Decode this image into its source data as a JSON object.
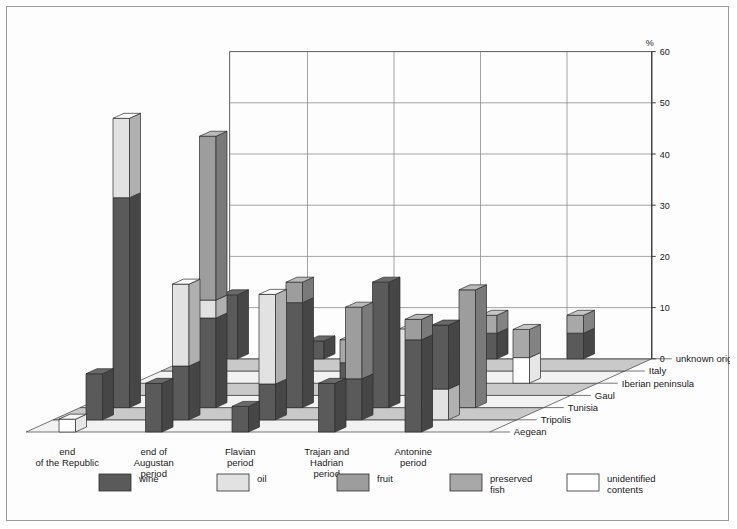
{
  "chart_data": {
    "type": "bar",
    "title": "",
    "subtitle": "",
    "xlabel": "",
    "ylabel": "%",
    "ylim": [
      0,
      60
    ],
    "yticks": [
      0,
      10,
      20,
      30,
      40,
      50,
      60
    ],
    "grid": true,
    "legend_position": "bottom",
    "projection": "3d-stacked",
    "categories": [
      "end\nof the Republic",
      "end of\nAugustan\nperiod",
      "Flavian\nperiod",
      "Trajan and\nHadrian\nperiod",
      "Antonine\nperiod"
    ],
    "depth_categories": [
      "unknown origin",
      "Italy",
      "Iberian peninsula",
      "Gaul",
      "Tunisia",
      "Tripolis",
      "Aegean"
    ],
    "series": [
      {
        "name": "wine",
        "color": "#5a5a5a"
      },
      {
        "name": "oil",
        "color": "#e2e2e2"
      },
      {
        "name": "fruit",
        "color": "#9d9d9d"
      },
      {
        "name": "preserved fish",
        "color": "#a8a8a8"
      },
      {
        "name": "unidentified contents",
        "color": "#ffffff"
      }
    ],
    "bars": [
      {
        "period": 0,
        "origin": 6,
        "stack": [
          {
            "s": "wine",
            "v": 12.5
          }
        ]
      },
      {
        "period": 0,
        "origin": 5,
        "stack": [
          {
            "s": "unidentified contents",
            "v": 3.0
          }
        ]
      },
      {
        "period": 0,
        "origin": 2,
        "stack": [
          {
            "s": "wine",
            "v": 41.0
          },
          {
            "s": "oil",
            "v": 15.5
          }
        ]
      },
      {
        "period": 0,
        "origin": 1,
        "stack": [
          {
            "s": "wine",
            "v": 9.0
          }
        ]
      },
      {
        "period": 0,
        "origin": 0,
        "stack": [
          {
            "s": "unidentified contents",
            "v": 2.5
          }
        ]
      },
      {
        "period": 1,
        "origin": 6,
        "stack": [
          {
            "s": "wine",
            "v": 3.5
          }
        ]
      },
      {
        "period": 1,
        "origin": 5,
        "stack": [
          {
            "s": "unidentified contents",
            "v": 3.0
          }
        ]
      },
      {
        "period": 1,
        "origin": 2,
        "stack": [
          {
            "s": "wine",
            "v": 17.5
          },
          {
            "s": "oil",
            "v": 3.5
          },
          {
            "s": "fruit",
            "v": 32.0
          }
        ]
      },
      {
        "period": 1,
        "origin": 1,
        "stack": [
          {
            "s": "wine",
            "v": 10.5
          },
          {
            "s": "oil",
            "v": 16.0
          }
        ]
      },
      {
        "period": 1,
        "origin": 0,
        "stack": [
          {
            "s": "wine",
            "v": 9.5
          }
        ]
      },
      {
        "period": 2,
        "origin": 6,
        "stack": [
          {
            "s": "wine",
            "v": 4.5
          }
        ]
      },
      {
        "period": 2,
        "origin": 4,
        "stack": [
          {
            "s": "wine",
            "v": 4.0
          },
          {
            "s": "preserved fish",
            "v": 4.5
          }
        ]
      },
      {
        "period": 2,
        "origin": 2,
        "stack": [
          {
            "s": "wine",
            "v": 20.5
          },
          {
            "s": "fruit",
            "v": 4.0
          }
        ]
      },
      {
        "period": 2,
        "origin": 1,
        "stack": [
          {
            "s": "wine",
            "v": 7.0
          },
          {
            "s": "oil",
            "v": 17.5
          }
        ]
      },
      {
        "period": 2,
        "origin": 0,
        "stack": [
          {
            "s": "wine",
            "v": 5.0
          }
        ]
      },
      {
        "period": 3,
        "origin": 6,
        "stack": [
          {
            "s": "wine",
            "v": 5.0
          },
          {
            "s": "preserved fish",
            "v": 3.5
          }
        ]
      },
      {
        "period": 3,
        "origin": 3,
        "stack": [
          {
            "s": "oil",
            "v": 13.0
          }
        ]
      },
      {
        "period": 3,
        "origin": 2,
        "stack": [
          {
            "s": "wine",
            "v": 24.5
          }
        ]
      },
      {
        "period": 3,
        "origin": 1,
        "stack": [
          {
            "s": "wine",
            "v": 8.0
          },
          {
            "s": "fruit",
            "v": 14.0
          }
        ]
      },
      {
        "period": 3,
        "origin": 0,
        "stack": [
          {
            "s": "wine",
            "v": 9.5
          }
        ]
      },
      {
        "period": 4,
        "origin": 6,
        "stack": [
          {
            "s": "wine",
            "v": 5.0
          },
          {
            "s": "preserved fish",
            "v": 3.5
          }
        ]
      },
      {
        "period": 4,
        "origin": 4,
        "stack": [
          {
            "s": "unidentified contents",
            "v": 5.0
          },
          {
            "s": "preserved fish",
            "v": 5.5
          }
        ]
      },
      {
        "period": 4,
        "origin": 2,
        "stack": [
          {
            "s": "fruit",
            "v": 23.0
          }
        ]
      },
      {
        "period": 4,
        "origin": 1,
        "stack": [
          {
            "s": "oil",
            "v": 6.0
          },
          {
            "s": "wine",
            "v": 12.5
          }
        ]
      },
      {
        "period": 4,
        "origin": 0,
        "stack": [
          {
            "s": "wine",
            "v": 18.0
          },
          {
            "s": "fruit",
            "v": 4.0
          }
        ]
      }
    ]
  },
  "axis": {
    "unit_label": "%",
    "tick_labels": [
      "0",
      "10",
      "20",
      "30",
      "40",
      "50",
      "60"
    ]
  },
  "legend": {
    "items": [
      {
        "label": "wine",
        "color": "#5a5a5a"
      },
      {
        "label": "oil",
        "color": "#e2e2e2"
      },
      {
        "label": "fruit",
        "color": "#9d9d9d"
      },
      {
        "label": "preserved\nfish",
        "color": "#a8a8a8"
      },
      {
        "label": "unidentified\ncontents",
        "color": "#ffffff"
      }
    ]
  },
  "colors": {
    "wine": "#5a5a5a",
    "oil": "#e2e2e2",
    "fruit": "#9d9d9d",
    "preserved_fish": "#a8a8a8",
    "unidentified": "#ffffff",
    "floor_light": "#f2f2f2",
    "floor_dark": "#c9c9c9",
    "frame": "#9a9a9a",
    "grid": "#8d8d8d"
  }
}
